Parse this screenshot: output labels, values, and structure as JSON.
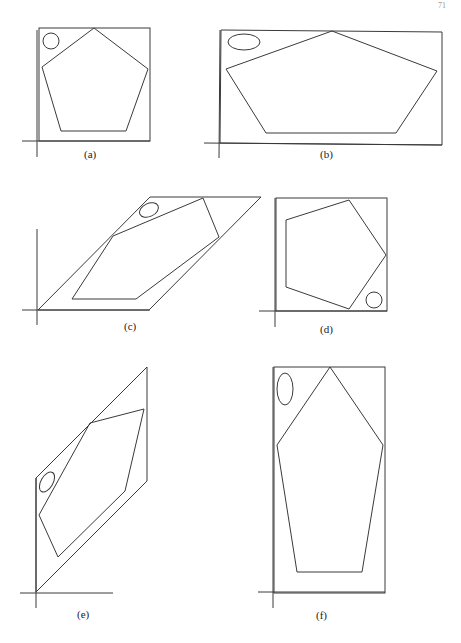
{
  "page_number": "71",
  "panels": [
    {
      "id": "a",
      "label": "(a)",
      "description": "Regular pentagon with small circle inside square frame"
    },
    {
      "id": "b",
      "label": "(b)",
      "description": "Horizontally stretched pentagon with ellipse inside wide rectangle"
    },
    {
      "id": "c",
      "label": "(c)",
      "description": "Horizontally sheared pentagon with ellipse inside parallelogram"
    },
    {
      "id": "d",
      "label": "(d)",
      "description": "Rotated pentagon with circle inside square frame"
    },
    {
      "id": "e",
      "label": "(e)",
      "description": "Vertically sheared pentagon with ellipse inside parallelogram"
    },
    {
      "id": "f",
      "label": "(f)",
      "description": "Vertically stretched pentagon with ellipse inside tall rectangle"
    }
  ]
}
